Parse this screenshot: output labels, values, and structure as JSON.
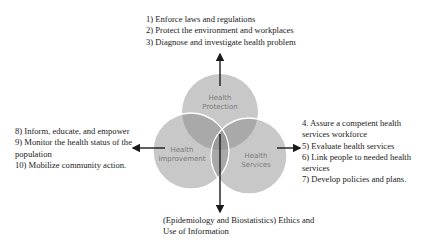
{
  "top_list": {
    "items": [
      "1) Enforce laws and regulations",
      "2) Protect the environment and workplaces",
      "3) Diagnose and investigate health problem"
    ]
  },
  "left_list": {
    "items": [
      "8) Inform, educate, and empower",
      "9) Monitor the health status of the",
      "population",
      "10) Mobilize community action."
    ]
  },
  "right_list": {
    "items": [
      "4. Assure a competent health",
      "services workforce",
      "5) Evaluate health services",
      "6) Link people to needed health",
      "services",
      "7) Develop policies and plans."
    ]
  },
  "bottom_text": {
    "lines": [
      "(Epidemiology and Biostatistics) Ethics and",
      "Use of Information"
    ]
  },
  "circles": {
    "protection": {
      "line1": "Health",
      "line2": "Protection"
    },
    "improvement": {
      "line1": "Health",
      "line2": "Improvement"
    },
    "services": {
      "line1": "Health",
      "line2": "Services"
    }
  },
  "colors": {
    "circle_fill": "#c8c8c8",
    "overlap_fill": "#a9a9a9",
    "center_fill": "#9a9a9a",
    "circle_stroke": "#ffffff",
    "arrow": "#1a1a1a",
    "label": "#7a7a7a"
  }
}
